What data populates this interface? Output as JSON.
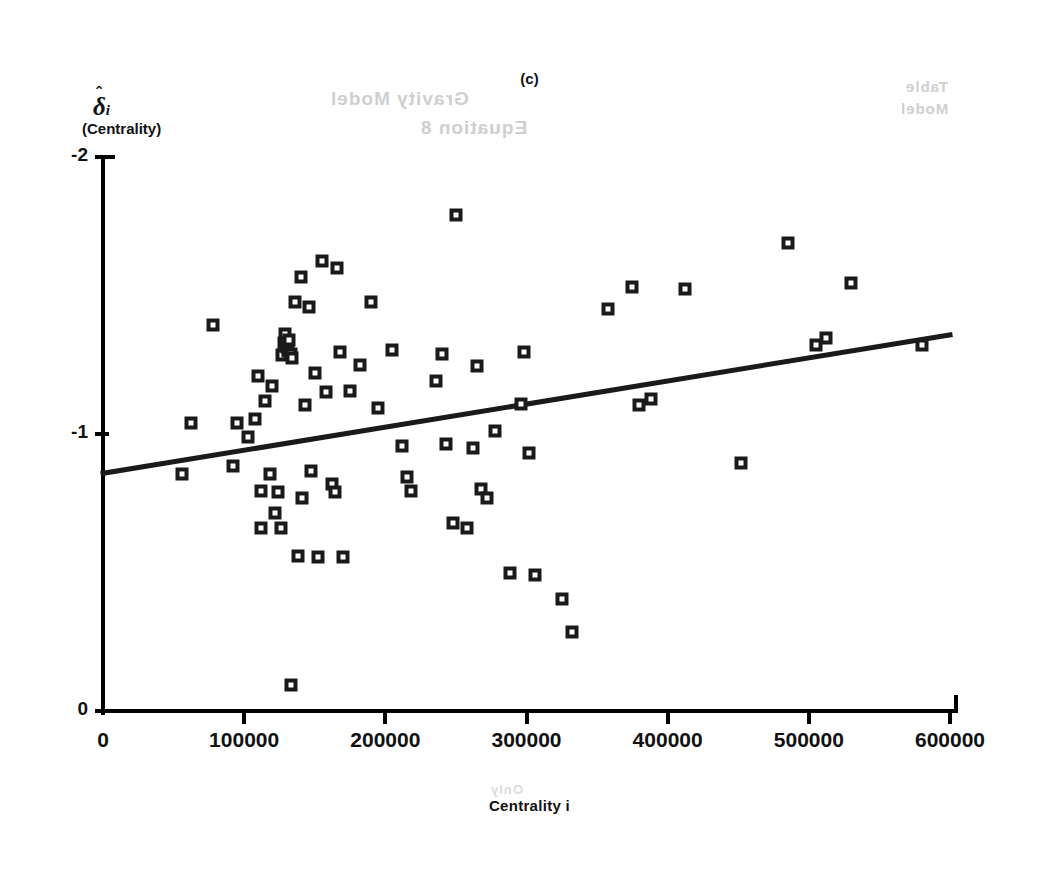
{
  "figure": {
    "title": "(c)",
    "xlabel": "Centrality i",
    "ylabel_symbol": "δ",
    "ylabel_hat": "ˆ",
    "ylabel_sub": "i",
    "ylabel_paren": "(Centrality)",
    "ink_color": "#1a1a1a",
    "paper_color": "#ffffff"
  },
  "ghost_text": {
    "line1": "Gravity Model",
    "line2": "Equation 8",
    "line3": "Table",
    "line4": "Model",
    "line5": "Only"
  },
  "chart_data": {
    "type": "scatter",
    "title": "(c)",
    "xlabel": "Centrality i",
    "ylabel": "δ̂i (Centrality)",
    "xlim": [
      0,
      600000
    ],
    "ylim": [
      0,
      -2
    ],
    "y_axis_inverted": true,
    "grid": false,
    "legend": null,
    "xticks": [
      0,
      100000,
      200000,
      300000,
      400000,
      500000,
      600000
    ],
    "xtick_labels": [
      "0",
      "100000",
      "200000",
      "300000",
      "400000",
      "500000",
      "600000"
    ],
    "yticks": [
      -2,
      -1,
      0
    ],
    "ytick_labels": [
      "-2",
      "-1",
      "0"
    ],
    "marker": "open-square",
    "points": [
      {
        "x": 62000,
        "y": -1.04
      },
      {
        "x": 56000,
        "y": -0.855
      },
      {
        "x": 78000,
        "y": -1.395
      },
      {
        "x": 92000,
        "y": -0.885
      },
      {
        "x": 95000,
        "y": -1.04
      },
      {
        "x": 103000,
        "y": -0.99
      },
      {
        "x": 108000,
        "y": -1.055
      },
      {
        "x": 110000,
        "y": -1.21
      },
      {
        "x": 112000,
        "y": -0.795
      },
      {
        "x": 112000,
        "y": -0.66
      },
      {
        "x": 115000,
        "y": -1.12
      },
      {
        "x": 118000,
        "y": -0.855
      },
      {
        "x": 120000,
        "y": -1.175
      },
      {
        "x": 122000,
        "y": -0.715
      },
      {
        "x": 124000,
        "y": -0.79
      },
      {
        "x": 126000,
        "y": -0.66
      },
      {
        "x": 127000,
        "y": -1.285
      },
      {
        "x": 128000,
        "y": -1.33
      },
      {
        "x": 129000,
        "y": -1.36
      },
      {
        "x": 130000,
        "y": -1.315
      },
      {
        "x": 131000,
        "y": -1.3
      },
      {
        "x": 132000,
        "y": -1.34
      },
      {
        "x": 133000,
        "y": -1.29
      },
      {
        "x": 133000,
        "y": -0.095
      },
      {
        "x": 134000,
        "y": -1.275
      },
      {
        "x": 136000,
        "y": -1.475
      },
      {
        "x": 138000,
        "y": -0.56
      },
      {
        "x": 140000,
        "y": -1.565
      },
      {
        "x": 141000,
        "y": -0.77
      },
      {
        "x": 143000,
        "y": -1.105
      },
      {
        "x": 146000,
        "y": -1.46
      },
      {
        "x": 147000,
        "y": -0.865
      },
      {
        "x": 150000,
        "y": -1.22
      },
      {
        "x": 152000,
        "y": -0.555
      },
      {
        "x": 155000,
        "y": -1.625
      },
      {
        "x": 158000,
        "y": -1.15
      },
      {
        "x": 162000,
        "y": -0.82
      },
      {
        "x": 164000,
        "y": -0.79
      },
      {
        "x": 166000,
        "y": -1.6
      },
      {
        "x": 168000,
        "y": -1.295
      },
      {
        "x": 170000,
        "y": -0.555
      },
      {
        "x": 175000,
        "y": -1.155
      },
      {
        "x": 182000,
        "y": -1.25
      },
      {
        "x": 190000,
        "y": -1.475
      },
      {
        "x": 195000,
        "y": -1.095
      },
      {
        "x": 205000,
        "y": -1.305
      },
      {
        "x": 212000,
        "y": -0.955
      },
      {
        "x": 215000,
        "y": -0.845
      },
      {
        "x": 218000,
        "y": -0.795
      },
      {
        "x": 236000,
        "y": -1.19
      },
      {
        "x": 240000,
        "y": -1.29
      },
      {
        "x": 243000,
        "y": -0.965
      },
      {
        "x": 248000,
        "y": -0.68
      },
      {
        "x": 250000,
        "y": -1.79
      },
      {
        "x": 258000,
        "y": -0.66
      },
      {
        "x": 262000,
        "y": -0.95
      },
      {
        "x": 265000,
        "y": -1.245
      },
      {
        "x": 268000,
        "y": -0.8
      },
      {
        "x": 272000,
        "y": -0.77
      },
      {
        "x": 278000,
        "y": -1.01
      },
      {
        "x": 288000,
        "y": -0.5
      },
      {
        "x": 296000,
        "y": -1.11
      },
      {
        "x": 298000,
        "y": -1.295
      },
      {
        "x": 302000,
        "y": -0.93
      },
      {
        "x": 306000,
        "y": -0.49
      },
      {
        "x": 325000,
        "y": -0.405
      },
      {
        "x": 332000,
        "y": -0.285
      },
      {
        "x": 358000,
        "y": -1.45
      },
      {
        "x": 375000,
        "y": -1.53
      },
      {
        "x": 380000,
        "y": -1.105
      },
      {
        "x": 388000,
        "y": -1.125
      },
      {
        "x": 412000,
        "y": -1.525
      },
      {
        "x": 452000,
        "y": -0.895
      },
      {
        "x": 485000,
        "y": -1.69
      },
      {
        "x": 505000,
        "y": -1.32
      },
      {
        "x": 512000,
        "y": -1.345
      },
      {
        "x": 530000,
        "y": -1.545
      },
      {
        "x": 580000,
        "y": -1.32
      }
    ],
    "fit_line": {
      "label": "least-squares fit",
      "x_start": 0,
      "y_start": -0.858,
      "x_end": 600000,
      "y_end": -1.358
    }
  }
}
